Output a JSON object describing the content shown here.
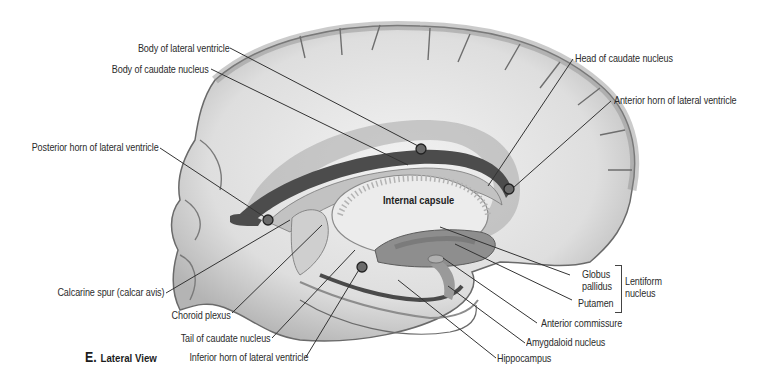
{
  "figure": {
    "caption_letter": "E.",
    "caption_text": "Lateral View",
    "inner_label": "Internal capsule",
    "group_label_line1": "Lentiform",
    "group_label_line2": "nucleus"
  },
  "labels_left": [
    {
      "id": "body-lateral-ventricle",
      "text": "Body of lateral ventricle"
    },
    {
      "id": "body-caudate-nucleus",
      "text": "Body of caudate nucleus"
    },
    {
      "id": "posterior-horn",
      "text": "Posterior horn of lateral ventricle"
    },
    {
      "id": "calcarine-spur",
      "text": "Calcarine spur (calcar avis)"
    },
    {
      "id": "choroid-plexus",
      "text": "Choroid plexus"
    },
    {
      "id": "tail-caudate",
      "text": "Tail of caudate nucleus"
    },
    {
      "id": "inferior-horn",
      "text": "Inferior horn of lateral ventricle"
    }
  ],
  "labels_right": [
    {
      "id": "head-caudate",
      "text": "Head of caudate nucleus"
    },
    {
      "id": "anterior-horn",
      "text": "Anterior horn of lateral ventricle"
    },
    {
      "id": "globus-pallidus-1",
      "text": "Globus"
    },
    {
      "id": "globus-pallidus-2",
      "text": "pallidus"
    },
    {
      "id": "putamen",
      "text": "Putamen"
    },
    {
      "id": "anterior-commissure",
      "text": "Anterior commissure"
    },
    {
      "id": "amygdaloid",
      "text": "Amygdaloid nucleus"
    },
    {
      "id": "hippocampus",
      "text": "Hippocampus"
    }
  ],
  "colors": {
    "background": "#ffffff",
    "leader": "#333333",
    "brain_light": "#e6e6e6",
    "brain_mid": "#b9b9b9",
    "brain_dark": "#5e5e5e",
    "ventricle": "#4a4a4a"
  }
}
